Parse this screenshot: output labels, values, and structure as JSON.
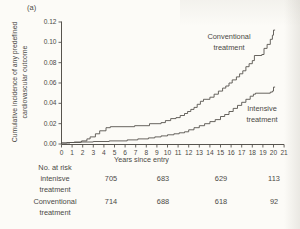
{
  "panel_label": "(a)",
  "colors": {
    "background": "#fcfbf7",
    "line": "#57544e",
    "axis": "#57544e",
    "text": "#4b4945"
  },
  "chart_data": {
    "type": "line",
    "step": true,
    "title": "",
    "xlabel": "Years since entry",
    "ylabel": "Cumulative incidence of any predefined cardiovascular outcome",
    "ylabel_lines": [
      "Cumulative incidence of any predefined",
      "cardiovascular outcome"
    ],
    "xlim": [
      0,
      21
    ],
    "ylim": [
      0,
      0.12
    ],
    "x_ticks": [
      0,
      1,
      2,
      3,
      4,
      5,
      6,
      7,
      8,
      9,
      10,
      11,
      12,
      13,
      14,
      15,
      16,
      17,
      18,
      19,
      20,
      21
    ],
    "y_ticks": [
      "0.00",
      "0.02",
      "0.04",
      "0.06",
      "0.08",
      "0.10",
      "0.12"
    ],
    "grid": false,
    "legend_position": "inline-annotations",
    "annotations": [
      {
        "line1": "Conventional",
        "line2": "treatment"
      },
      {
        "line1": "Intensive",
        "line2": "treatment"
      }
    ],
    "series": [
      {
        "name": "Conventional treatment",
        "points": [
          [
            0,
            0.001
          ],
          [
            0.5,
            0.0015
          ],
          [
            1.2,
            0.002
          ],
          [
            1.9,
            0.003
          ],
          [
            2.4,
            0.005
          ],
          [
            2.7,
            0.007
          ],
          [
            3.2,
            0.01
          ],
          [
            3.6,
            0.013
          ],
          [
            4.2,
            0.016
          ],
          [
            4.6,
            0.017
          ],
          [
            6.9,
            0.018
          ],
          [
            8.3,
            0.02
          ],
          [
            9.4,
            0.021
          ],
          [
            9.8,
            0.023
          ],
          [
            10.3,
            0.025
          ],
          [
            10.8,
            0.026
          ],
          [
            11.2,
            0.028
          ],
          [
            11.6,
            0.03
          ],
          [
            11.9,
            0.032
          ],
          [
            12.2,
            0.034
          ],
          [
            12.5,
            0.036
          ],
          [
            12.8,
            0.039
          ],
          [
            13.1,
            0.042
          ],
          [
            13.4,
            0.044
          ],
          [
            14.0,
            0.046
          ],
          [
            14.4,
            0.049
          ],
          [
            14.8,
            0.052
          ],
          [
            15.2,
            0.055
          ],
          [
            15.5,
            0.057
          ],
          [
            15.8,
            0.06
          ],
          [
            16.1,
            0.063
          ],
          [
            16.5,
            0.066
          ],
          [
            16.8,
            0.069
          ],
          [
            17.1,
            0.072
          ],
          [
            17.4,
            0.076
          ],
          [
            17.7,
            0.079
          ],
          [
            18.0,
            0.082
          ],
          [
            18.2,
            0.087
          ],
          [
            18.9,
            0.088
          ],
          [
            19.1,
            0.094
          ],
          [
            19.4,
            0.098
          ],
          [
            19.7,
            0.103
          ],
          [
            19.9,
            0.107
          ],
          [
            20.0,
            0.112
          ],
          [
            20.15,
            0.112
          ]
        ]
      },
      {
        "name": "Intensive treatment",
        "points": [
          [
            0,
            0.001
          ],
          [
            0.8,
            0.0015
          ],
          [
            1.8,
            0.002
          ],
          [
            3.0,
            0.0025
          ],
          [
            4.5,
            0.003
          ],
          [
            6.2,
            0.004
          ],
          [
            7.2,
            0.005
          ],
          [
            8.2,
            0.006
          ],
          [
            8.8,
            0.007
          ],
          [
            9.4,
            0.008
          ],
          [
            10.0,
            0.009
          ],
          [
            10.6,
            0.01
          ],
          [
            11.1,
            0.011
          ],
          [
            11.6,
            0.012
          ],
          [
            12.0,
            0.014
          ],
          [
            12.5,
            0.016
          ],
          [
            13.0,
            0.018
          ],
          [
            13.5,
            0.02
          ],
          [
            14.0,
            0.022
          ],
          [
            14.5,
            0.024
          ],
          [
            15.0,
            0.027
          ],
          [
            15.4,
            0.029
          ],
          [
            15.8,
            0.032
          ],
          [
            16.2,
            0.035
          ],
          [
            16.6,
            0.038
          ],
          [
            17.0,
            0.041
          ],
          [
            17.4,
            0.044
          ],
          [
            17.8,
            0.047
          ],
          [
            18.1,
            0.049
          ],
          [
            18.3,
            0.05
          ],
          [
            19.7,
            0.051
          ],
          [
            19.9,
            0.052
          ],
          [
            20.0,
            0.056
          ],
          [
            20.15,
            0.056
          ]
        ]
      }
    ]
  },
  "risk_table": {
    "header": "No. at risk",
    "rows": [
      {
        "label_line1": "intenisve",
        "label_line2": "treatment",
        "values": [
          "705",
          "683",
          "629",
          "113"
        ]
      },
      {
        "label_line1": "Conventional",
        "label_line2": "treatment",
        "values": [
          "714",
          "688",
          "618",
          "92"
        ]
      }
    ]
  }
}
